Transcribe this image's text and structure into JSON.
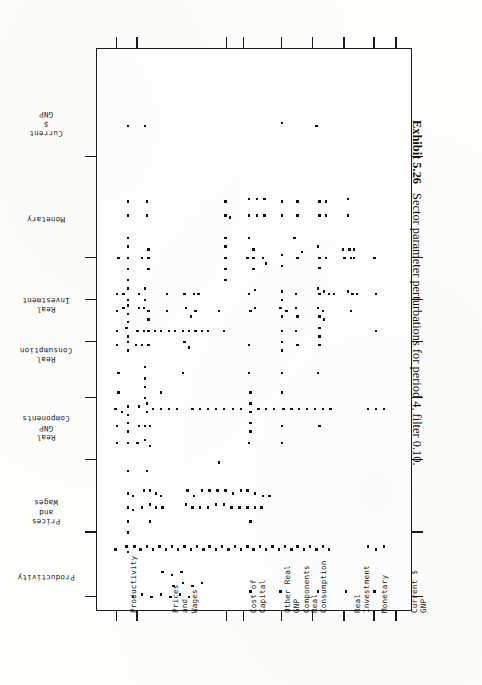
{
  "caption": {
    "number": "Exhibit 5.26",
    "text": "Sector parameter perturbations for period 4, filter 0.10."
  },
  "y_axis": {
    "title": "",
    "labels": [
      {
        "text": "Current\n$\nGNP",
        "pos_pct": 13.5
      },
      {
        "text": "Monetary",
        "pos_pct": 30.5
      },
      {
        "text": "Real\nInvestment",
        "pos_pct": 45.5
      },
      {
        "text": "Real\nConsumption",
        "pos_pct": 54.5
      },
      {
        "text": "Real\nGNP\nComponents",
        "pos_pct": 67.5
      },
      {
        "text": "Prices\nand\nWages",
        "pos_pct": 82.5
      },
      {
        "text": "Productivity",
        "pos_pct": 94.0
      }
    ],
    "ticks_pct": [
      19.0,
      37.0,
      44.5,
      52.0,
      62.0,
      73.0,
      86.0,
      97.5
    ]
  },
  "x_axis": {
    "title": "",
    "labels": [
      {
        "text": "Productivity",
        "pos_pct": 8.0
      },
      {
        "text": "Prices\nand\nWages",
        "pos_pct": 15.5
      },
      {
        "text": "Cost of\nCapital",
        "pos_pct": 43.0
      },
      {
        "text": "Other Real\nGNP\nComponents",
        "pos_pct": 51.0
      },
      {
        "text": "Real\nConsumption",
        "pos_pct": 62.5
      },
      {
        "text": "Real\nInvestment",
        "pos_pct": 76.0
      },
      {
        "text": "Monetary",
        "pos_pct": 87.5
      },
      {
        "text": "Current $\nGNP",
        "pos_pct": 94.0
      }
    ],
    "ticks_pct": [
      6.0,
      12.5,
      41.0,
      46.5,
      58.5,
      68.5,
      78.5,
      88.0,
      95.0
    ]
  },
  "chart_data": {
    "type": "scatter",
    "title": "Sector parameter perturbations for period 4, filter 0.10.",
    "xlabel": "",
    "ylabel": "",
    "xlim": [
      0,
      100
    ],
    "ylim": [
      0,
      100
    ],
    "grid": false,
    "legend": "none",
    "marker": "square-dot",
    "marker_color": "#101010",
    "note": "Dot-matrix occurrence plot: each dot marks a perturbed sector-parameter pair. Coordinates below are percent of plot width (x, left-to-right) and percent of plot height (y, top-to-bottom).",
    "points": [
      [
        9.5,
        13.5
      ],
      [
        15.0,
        13.5
      ],
      [
        58.5,
        13.0
      ],
      [
        69.5,
        13.5
      ],
      [
        9.5,
        27.0
      ],
      [
        9.5,
        29.5
      ],
      [
        15.5,
        27.0
      ],
      [
        15.5,
        29.5
      ],
      [
        40.5,
        27.0
      ],
      [
        40.5,
        29.5
      ],
      [
        42.0,
        29.8
      ],
      [
        48.0,
        26.5
      ],
      [
        50.5,
        26.5
      ],
      [
        53.0,
        26.5
      ],
      [
        48.0,
        29.5
      ],
      [
        50.5,
        29.5
      ],
      [
        53.0,
        29.5
      ],
      [
        58.5,
        27.0
      ],
      [
        58.5,
        29.5
      ],
      [
        63.5,
        27.0
      ],
      [
        63.5,
        29.5
      ],
      [
        70.5,
        27.0
      ],
      [
        72.5,
        27.0
      ],
      [
        70.5,
        29.5
      ],
      [
        72.5,
        29.5
      ],
      [
        79.5,
        26.5
      ],
      [
        79.5,
        29.5
      ],
      [
        9.5,
        33.5
      ],
      [
        40.5,
        33.5
      ],
      [
        48.0,
        33.5
      ],
      [
        62.5,
        33.5
      ],
      [
        6.5,
        37.0
      ],
      [
        9.5,
        35.0
      ],
      [
        9.5,
        37.0
      ],
      [
        9.5,
        39.0
      ],
      [
        9.5,
        41.0
      ],
      [
        14.0,
        37.0
      ],
      [
        16.0,
        35.5
      ],
      [
        16.0,
        37.0
      ],
      [
        16.0,
        39.0
      ],
      [
        40.5,
        35.0
      ],
      [
        40.5,
        37.0
      ],
      [
        40.5,
        39.0
      ],
      [
        40.5,
        41.0
      ],
      [
        47.5,
        37.0
      ],
      [
        49.5,
        35.5
      ],
      [
        49.5,
        37.0
      ],
      [
        49.5,
        39.0
      ],
      [
        52.5,
        37.0
      ],
      [
        53.5,
        38.0
      ],
      [
        58.5,
        36.5
      ],
      [
        58.5,
        38.5
      ],
      [
        63.5,
        37.0
      ],
      [
        65.0,
        36.0
      ],
      [
        70.0,
        35.0
      ],
      [
        70.5,
        37.0
      ],
      [
        70.5,
        38.8
      ],
      [
        72.5,
        37.0
      ],
      [
        78.0,
        35.5
      ],
      [
        78.5,
        37.0
      ],
      [
        80.0,
        35.5
      ],
      [
        80.5,
        37.0
      ],
      [
        81.5,
        35.5
      ],
      [
        81.5,
        37.0
      ],
      [
        88.0,
        37.0
      ],
      [
        6.0,
        43.5
      ],
      [
        8.0,
        43.5
      ],
      [
        9.5,
        42.5
      ],
      [
        9.5,
        44.5
      ],
      [
        13.0,
        43.5
      ],
      [
        15.0,
        42.5
      ],
      [
        15.0,
        44.5
      ],
      [
        22.0,
        43.5
      ],
      [
        27.5,
        43.5
      ],
      [
        30.5,
        43.5
      ],
      [
        32.0,
        43.5
      ],
      [
        48.0,
        43.5
      ],
      [
        50.0,
        42.8
      ],
      [
        58.5,
        43.0
      ],
      [
        58.5,
        44.5
      ],
      [
        63.0,
        43.5
      ],
      [
        70.0,
        42.5
      ],
      [
        70.5,
        43.5
      ],
      [
        72.0,
        43.0
      ],
      [
        73.5,
        43.5
      ],
      [
        75.0,
        43.5
      ],
      [
        79.5,
        43.0
      ],
      [
        81.0,
        43.5
      ],
      [
        82.5,
        43.5
      ],
      [
        88.5,
        43.5
      ],
      [
        6.0,
        46.5
      ],
      [
        8.0,
        46.0
      ],
      [
        9.5,
        45.5
      ],
      [
        9.5,
        47.0
      ],
      [
        9.5,
        48.5
      ],
      [
        13.0,
        46.0
      ],
      [
        14.5,
        46.0
      ],
      [
        16.0,
        46.5
      ],
      [
        16.0,
        48.0
      ],
      [
        22.0,
        46.5
      ],
      [
        28.0,
        46.0
      ],
      [
        29.5,
        47.5
      ],
      [
        31.0,
        46.5
      ],
      [
        38.5,
        46.5
      ],
      [
        48.5,
        46.5
      ],
      [
        50.0,
        46.0
      ],
      [
        58.0,
        46.0
      ],
      [
        58.5,
        47.5
      ],
      [
        60.0,
        46.5
      ],
      [
        63.0,
        46.0
      ],
      [
        63.5,
        47.5
      ],
      [
        70.0,
        46.0
      ],
      [
        70.5,
        47.5
      ],
      [
        71.5,
        46.5
      ],
      [
        72.0,
        48.0
      ],
      [
        80.5,
        46.5
      ],
      [
        6.0,
        50.0
      ],
      [
        9.0,
        49.5
      ],
      [
        9.5,
        51.0
      ],
      [
        12.5,
        50.0
      ],
      [
        14.5,
        50.0
      ],
      [
        16.0,
        50.0
      ],
      [
        18.0,
        50.0
      ],
      [
        20.0,
        50.0
      ],
      [
        22.5,
        50.0
      ],
      [
        24.5,
        50.0
      ],
      [
        27.0,
        50.0
      ],
      [
        29.0,
        50.0
      ],
      [
        31.0,
        50.0
      ],
      [
        33.0,
        50.0
      ],
      [
        35.0,
        50.0
      ],
      [
        40.0,
        50.0
      ],
      [
        58.5,
        50.0
      ],
      [
        63.0,
        50.0
      ],
      [
        70.5,
        49.5
      ],
      [
        70.5,
        51.0
      ],
      [
        88.5,
        50.0
      ],
      [
        6.0,
        52.5
      ],
      [
        9.5,
        52.0
      ],
      [
        9.5,
        53.5
      ],
      [
        12.0,
        52.5
      ],
      [
        14.0,
        52.5
      ],
      [
        16.0,
        52.5
      ],
      [
        27.5,
        52.0
      ],
      [
        29.0,
        53.0
      ],
      [
        48.0,
        52.5
      ],
      [
        58.5,
        52.0
      ],
      [
        58.5,
        53.5
      ],
      [
        63.5,
        52.5
      ],
      [
        70.5,
        52.5
      ],
      [
        6.5,
        57.5
      ],
      [
        15.0,
        56.5
      ],
      [
        15.0,
        58.5
      ],
      [
        27.0,
        57.5
      ],
      [
        48.0,
        57.5
      ],
      [
        58.5,
        57.5
      ],
      [
        70.0,
        57.5
      ],
      [
        6.5,
        61.0
      ],
      [
        15.0,
        60.0
      ],
      [
        15.0,
        62.0
      ],
      [
        20.0,
        61.0
      ],
      [
        48.5,
        61.0
      ],
      [
        58.5,
        61.0
      ],
      [
        5.5,
        64.0
      ],
      [
        7.5,
        64.5
      ],
      [
        9.5,
        63.5
      ],
      [
        9.5,
        65.0
      ],
      [
        13.0,
        63.5
      ],
      [
        15.5,
        63.0
      ],
      [
        15.5,
        64.5
      ],
      [
        17.5,
        64.0
      ],
      [
        20.0,
        64.0
      ],
      [
        22.5,
        64.0
      ],
      [
        25.0,
        64.0
      ],
      [
        30.0,
        64.0
      ],
      [
        32.5,
        64.0
      ],
      [
        35.0,
        64.0
      ],
      [
        37.5,
        64.0
      ],
      [
        40.0,
        64.0
      ],
      [
        43.0,
        64.0
      ],
      [
        45.5,
        64.0
      ],
      [
        48.5,
        63.0
      ],
      [
        48.5,
        64.5
      ],
      [
        51.0,
        64.0
      ],
      [
        53.5,
        64.0
      ],
      [
        56.0,
        64.0
      ],
      [
        59.0,
        64.0
      ],
      [
        61.5,
        64.0
      ],
      [
        64.0,
        64.0
      ],
      [
        66.5,
        64.0
      ],
      [
        69.0,
        64.0
      ],
      [
        71.5,
        64.0
      ],
      [
        74.0,
        64.0
      ],
      [
        86.0,
        64.0
      ],
      [
        88.5,
        64.0
      ],
      [
        91.0,
        64.0
      ],
      [
        6.0,
        67.0
      ],
      [
        9.5,
        66.5
      ],
      [
        9.5,
        68.0
      ],
      [
        13.0,
        67.0
      ],
      [
        15.0,
        67.0
      ],
      [
        16.5,
        67.0
      ],
      [
        48.5,
        66.5
      ],
      [
        48.5,
        68.0
      ],
      [
        58.5,
        67.0
      ],
      [
        70.5,
        67.0
      ],
      [
        6.0,
        70.0
      ],
      [
        9.5,
        70.0
      ],
      [
        12.5,
        70.0
      ],
      [
        15.0,
        69.5
      ],
      [
        16.5,
        70.5
      ],
      [
        48.0,
        70.0
      ],
      [
        58.5,
        70.0
      ],
      [
        9.5,
        79.0
      ],
      [
        11.0,
        79.5
      ],
      [
        14.5,
        78.5
      ],
      [
        16.5,
        78.5
      ],
      [
        18.5,
        79.0
      ],
      [
        20.0,
        79.5
      ],
      [
        28.5,
        78.5
      ],
      [
        30.5,
        79.5
      ],
      [
        33.0,
        78.5
      ],
      [
        35.5,
        78.5
      ],
      [
        38.0,
        78.5
      ],
      [
        40.5,
        78.5
      ],
      [
        43.0,
        79.0
      ],
      [
        45.5,
        78.5
      ],
      [
        47.5,
        78.5
      ],
      [
        50.0,
        79.0
      ],
      [
        52.5,
        79.5
      ],
      [
        54.5,
        79.5
      ],
      [
        9.5,
        81.5
      ],
      [
        11.0,
        82.0
      ],
      [
        14.0,
        81.5
      ],
      [
        16.5,
        81.0
      ],
      [
        18.5,
        81.5
      ],
      [
        20.5,
        81.5
      ],
      [
        28.0,
        81.0
      ],
      [
        30.0,
        81.5
      ],
      [
        32.5,
        81.5
      ],
      [
        35.0,
        81.5
      ],
      [
        37.5,
        81.0
      ],
      [
        40.0,
        81.0
      ],
      [
        42.5,
        81.5
      ],
      [
        45.0,
        81.5
      ],
      [
        47.5,
        81.5
      ],
      [
        50.0,
        81.5
      ],
      [
        52.0,
        81.5
      ],
      [
        9.5,
        84.0
      ],
      [
        16.5,
        84.0
      ],
      [
        48.5,
        84.0
      ],
      [
        9.5,
        86.0
      ],
      [
        5.5,
        89.0
      ],
      [
        9.0,
        88.5
      ],
      [
        9.5,
        89.5
      ],
      [
        11.5,
        88.5
      ],
      [
        13.5,
        89.0
      ],
      [
        15.5,
        88.5
      ],
      [
        17.5,
        89.0
      ],
      [
        19.5,
        88.5
      ],
      [
        21.5,
        89.0
      ],
      [
        23.5,
        88.5
      ],
      [
        25.5,
        89.0
      ],
      [
        27.5,
        88.5
      ],
      [
        29.5,
        89.0
      ],
      [
        31.5,
        88.5
      ],
      [
        33.5,
        89.0
      ],
      [
        35.5,
        88.5
      ],
      [
        37.5,
        89.0
      ],
      [
        39.5,
        88.5
      ],
      [
        41.5,
        89.0
      ],
      [
        43.5,
        88.5
      ],
      [
        45.5,
        89.0
      ],
      [
        47.5,
        88.5
      ],
      [
        49.5,
        89.0
      ],
      [
        51.5,
        88.5
      ],
      [
        53.5,
        89.0
      ],
      [
        55.5,
        88.5
      ],
      [
        57.5,
        89.0
      ],
      [
        59.5,
        88.5
      ],
      [
        61.5,
        89.0
      ],
      [
        63.5,
        88.5
      ],
      [
        65.5,
        89.0
      ],
      [
        67.5,
        88.5
      ],
      [
        69.5,
        89.0
      ],
      [
        71.5,
        88.5
      ],
      [
        73.5,
        89.0
      ],
      [
        86.0,
        88.5
      ],
      [
        88.5,
        89.0
      ],
      [
        91.0,
        88.5
      ],
      [
        38.5,
        73.5
      ],
      [
        24.0,
        95.5
      ],
      [
        27.0,
        95.0
      ],
      [
        30.0,
        95.5
      ],
      [
        33.0,
        95.0
      ],
      [
        20.5,
        93.0
      ],
      [
        23.5,
        93.5
      ],
      [
        26.5,
        93.0
      ],
      [
        11.0,
        97.5
      ],
      [
        14.0,
        97.0
      ],
      [
        17.0,
        97.5
      ],
      [
        20.0,
        97.0
      ],
      [
        23.0,
        97.5
      ],
      [
        26.0,
        97.0
      ],
      [
        29.0,
        97.5
      ],
      [
        48.5,
        96.5
      ],
      [
        58.0,
        96.5
      ],
      [
        70.0,
        96.5
      ],
      [
        79.0,
        96.5
      ],
      [
        88.0,
        96.5
      ],
      [
        9.5,
        75.0
      ],
      [
        15.5,
        75.0
      ]
    ]
  }
}
